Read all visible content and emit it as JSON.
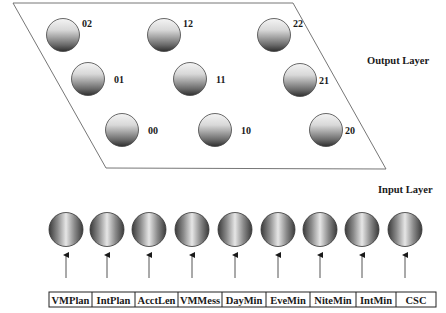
{
  "output_layer": {
    "label": "Output Layer",
    "nodes": [
      {
        "id": "02",
        "cx": 63,
        "cy": 35
      },
      {
        "id": "12",
        "cx": 164,
        "cy": 35
      },
      {
        "id": "22",
        "cx": 274,
        "cy": 35
      },
      {
        "id": "01",
        "cx": 88,
        "cy": 79
      },
      {
        "id": "11",
        "cx": 190,
        "cy": 79
      },
      {
        "id": "21",
        "cx": 300,
        "cy": 80
      },
      {
        "id": "00",
        "cx": 122,
        "cy": 130
      },
      {
        "id": "10",
        "cx": 215,
        "cy": 130
      },
      {
        "id": "20",
        "cx": 326,
        "cy": 130
      }
    ]
  },
  "input_layer": {
    "label": "Input Layer",
    "nodes": [
      {
        "cx": 66
      },
      {
        "cx": 107
      },
      {
        "cx": 149
      },
      {
        "cx": 192
      },
      {
        "cx": 235
      },
      {
        "cx": 278
      },
      {
        "cx": 320
      },
      {
        "cx": 362
      },
      {
        "cx": 405
      }
    ]
  },
  "input_table": {
    "cells": [
      "VMPlan",
      "IntPlan",
      "AcctLen",
      "VMMess",
      "DayMin",
      "EveMin",
      "NiteMin",
      "IntMin",
      "CSC"
    ],
    "borders": [
      49,
      92,
      135,
      178,
      222,
      266,
      310,
      356,
      396,
      436
    ]
  },
  "colors": {
    "line": "#555555",
    "text": "#1a1a1a"
  }
}
